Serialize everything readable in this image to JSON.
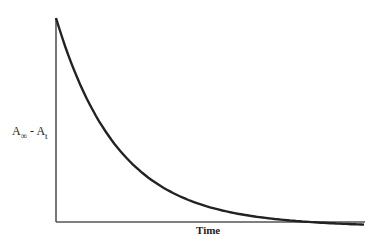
{
  "chart_data": {
    "type": "line",
    "title": "",
    "xlabel": "Time",
    "ylabel": "A∞ - At",
    "ylabel_parts": {
      "main": "A",
      "sub1": "∞",
      "sep": " - A",
      "sub2": "t"
    },
    "grid": false,
    "legend": null,
    "xticks": [],
    "yticks": [],
    "series": [
      {
        "name": "exponential decay",
        "color": "#222222",
        "x": [
          0,
          0.1,
          0.2,
          0.3,
          0.4,
          0.5,
          0.6,
          0.7,
          0.8,
          0.9,
          1.0
        ],
        "values": [
          1.0,
          0.6,
          0.37,
          0.23,
          0.14,
          0.09,
          0.055,
          0.035,
          0.022,
          0.014,
          0.01
        ]
      }
    ],
    "xlim": [
      0,
      1
    ],
    "ylim": [
      0,
      1
    ]
  }
}
